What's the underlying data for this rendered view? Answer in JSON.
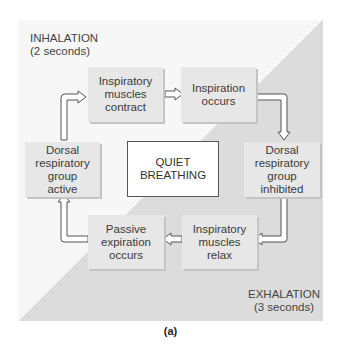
{
  "labels": {
    "inhalation": "INHALATION\n(2 seconds)",
    "exhalation": "EXHALATION\n(3 seconds)"
  },
  "center": "QUIET\nBREATHING",
  "boxes": {
    "muscles_contract": "Inspiratory\nmuscles\ncontract",
    "inspiration_occurs": "Inspiration\noccurs",
    "drg_inhibited": "Dorsal\nrespiratory\ngroup\ninhibited",
    "muscles_relax": "Inspiratory\nmuscles\nrelax",
    "passive_expiration": "Passive\nexpiration\noccurs",
    "drg_active": "Dorsal\nrespiratory\ngroup\nactive"
  },
  "caption": "(a)"
}
